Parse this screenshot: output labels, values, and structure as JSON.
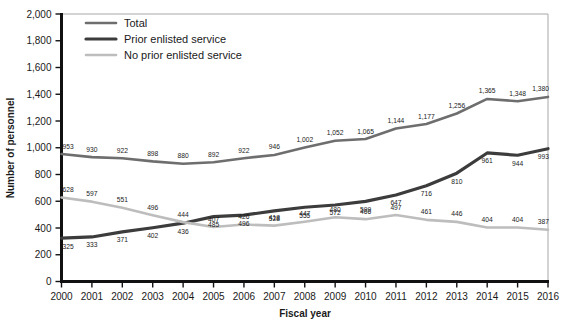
{
  "chart_data": {
    "type": "line",
    "title": "",
    "xlabel": "Fiscal year",
    "ylabel": "Number of personnel",
    "x": [
      2000,
      2001,
      2002,
      2003,
      2004,
      2005,
      2006,
      2007,
      2008,
      2009,
      2010,
      2011,
      2012,
      2013,
      2014,
      2015,
      2016
    ],
    "categories": [
      "2000",
      "2001",
      "2002",
      "2003",
      "2004",
      "2005",
      "2006",
      "2007",
      "2008",
      "2009",
      "2010",
      "2011",
      "2012",
      "2013",
      "2014",
      "2015",
      "2016"
    ],
    "xlim": [
      2000,
      2016
    ],
    "ylim": [
      0,
      2000
    ],
    "yticks": [
      0,
      200,
      400,
      600,
      800,
      1000,
      1200,
      1400,
      1600,
      1800,
      2000
    ],
    "ytick_labels": [
      "0",
      "200",
      "400",
      "600",
      "800",
      "1,000",
      "1,200",
      "1,400",
      "1,600",
      "1,800",
      "2,000"
    ],
    "grid": false,
    "legend_position": "top-left",
    "series": [
      {
        "name": "Total",
        "color": "#6e6e6e",
        "values": [
          953,
          930,
          922,
          898,
          880,
          892,
          922,
          946,
          1002,
          1052,
          1065,
          1144,
          1177,
          1256,
          1365,
          1348,
          1380
        ],
        "labels": [
          "953",
          "930",
          "922",
          "898",
          "880",
          "892",
          "922",
          "946",
          "1,002",
          "1,052",
          "1,065",
          "1,144",
          "1,177",
          "1,256",
          "1,365",
          "1,348",
          "1,380"
        ]
      },
      {
        "name": "Prior enlisted service",
        "color": "#3c3c3c",
        "values": [
          325,
          333,
          371,
          402,
          436,
          485,
          496,
          528,
          555,
          572,
          599,
          647,
          716,
          810,
          961,
          944,
          993
        ],
        "labels": [
          "325",
          "333",
          "371",
          "402",
          "436",
          "485",
          "496",
          "528",
          "555",
          "572",
          "599",
          "647",
          "716",
          "810",
          "961",
          "944",
          "993"
        ]
      },
      {
        "name": "No prior enlisted service",
        "color": "#bdbdbd",
        "values": [
          628,
          597,
          551,
          496,
          444,
          407,
          426,
          418,
          447,
          480,
          466,
          497,
          461,
          446,
          404,
          404,
          387
        ],
        "labels": [
          "628",
          "597",
          "551",
          "496",
          "444",
          "407",
          "426",
          "418",
          "447",
          "480",
          "466",
          "497",
          "461",
          "446",
          "404",
          "404",
          "387"
        ]
      }
    ]
  },
  "legend": {
    "items": [
      {
        "label": "Total",
        "color": "#6e6e6e",
        "width": 2.6
      },
      {
        "label": "Prior enlisted service",
        "color": "#3c3c3c",
        "width": 3.2
      },
      {
        "label": "No prior enlisted service",
        "color": "#bdbdbd",
        "width": 2.6
      }
    ]
  },
  "axes": {
    "x_title": "Fiscal year",
    "y_title": "Number of personnel"
  },
  "colors": {
    "axis": "#111111",
    "frame": "#9a9a9a",
    "text": "#1a1a1a"
  }
}
